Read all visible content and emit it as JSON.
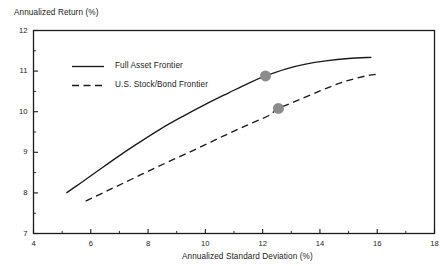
{
  "chart_data": {
    "type": "line",
    "title": "",
    "xlabel": "Annualized Standard Deviation (%)",
    "ylabel": "Annualized Return (%)",
    "xlim": [
      4,
      18
    ],
    "ylim": [
      7,
      12
    ],
    "xticks": [
      4,
      6,
      8,
      10,
      12,
      14,
      16,
      18
    ],
    "yticks": [
      7,
      8,
      9,
      10,
      11,
      12
    ],
    "xtick_labels": [
      "4",
      "6",
      "8",
      "10",
      "12",
      "14",
      "16",
      "18"
    ],
    "ytick_labels": [
      "7",
      "8",
      "9",
      "10",
      "11",
      "12"
    ],
    "x_minor_ticks": [
      5,
      7,
      9,
      11,
      13,
      15,
      17
    ],
    "y_minor_ticks": [
      7.5,
      8.5,
      9.5,
      10.5,
      11.5
    ],
    "grid": false,
    "legend_position": "upper-left-inside",
    "series": [
      {
        "name": "Full Asset Frontier",
        "style": "solid",
        "color": "#1a1a1a",
        "points": [
          [
            5.15,
            8.0
          ],
          [
            5.6,
            8.22
          ],
          [
            6.2,
            8.52
          ],
          [
            6.9,
            8.87
          ],
          [
            7.6,
            9.2
          ],
          [
            8.4,
            9.56
          ],
          [
            9.2,
            9.88
          ],
          [
            10.0,
            10.18
          ],
          [
            10.8,
            10.46
          ],
          [
            11.5,
            10.7
          ],
          [
            12.1,
            10.88
          ],
          [
            12.8,
            11.05
          ],
          [
            13.5,
            11.17
          ],
          [
            14.2,
            11.25
          ],
          [
            15.0,
            11.31
          ],
          [
            15.8,
            11.34
          ]
        ]
      },
      {
        "name": "U.S. Stock/Bond Frontier",
        "style": "dashed",
        "color": "#1a1a1a",
        "points": [
          [
            5.82,
            7.8
          ],
          [
            6.6,
            8.06
          ],
          [
            7.4,
            8.33
          ],
          [
            8.2,
            8.6
          ],
          [
            9.0,
            8.86
          ],
          [
            9.8,
            9.12
          ],
          [
            10.6,
            9.39
          ],
          [
            11.4,
            9.65
          ],
          [
            12.2,
            9.9
          ],
          [
            12.55,
            10.08
          ],
          [
            13.2,
            10.27
          ],
          [
            14.0,
            10.51
          ],
          [
            14.8,
            10.73
          ],
          [
            15.6,
            10.88
          ],
          [
            15.95,
            10.92
          ]
        ]
      }
    ],
    "markers": [
      {
        "label": "Full Asset Frontier marker",
        "series": "Full Asset Frontier",
        "x": 12.1,
        "y": 10.88,
        "color": "#8c8c8c",
        "radius": 5.5
      },
      {
        "label": "U.S. Stock/Bond Frontier marker",
        "series": "U.S. Stock/Bond Frontier",
        "x": 12.55,
        "y": 10.08,
        "color": "#8c8c8c",
        "radius": 5.5
      }
    ]
  },
  "legend": {
    "entries": [
      {
        "label": "Full Asset Frontier",
        "style": "solid"
      },
      {
        "label": "U.S. Stock/Bond Frontier",
        "style": "dashed"
      }
    ]
  },
  "colors": {
    "axis": "#1a1a1a",
    "line": "#1a1a1a",
    "marker": "#8c8c8c",
    "background": "#ffffff"
  }
}
